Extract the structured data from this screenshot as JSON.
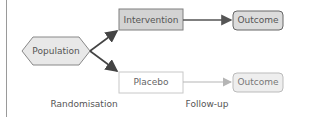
{
  "diagram": {
    "nodes": {
      "population": {
        "label": "Population",
        "shape": "hexagon",
        "fill": "#e8e8e8",
        "stroke": "#888888"
      },
      "intervention": {
        "label": "Intervention",
        "shape": "rectangle",
        "fill": "#d3d3d3",
        "stroke": "#7f7f7f"
      },
      "placebo": {
        "label": "Placebo",
        "shape": "rectangle",
        "fill": "#ffffff",
        "stroke": "#c8c8c8"
      },
      "outcome_top": {
        "label": "Outcome",
        "shape": "rounded-rectangle",
        "fill": "#dcdcdc",
        "stroke": "#666666"
      },
      "outcome_bottom": {
        "label": "Outcome",
        "shape": "rounded-rectangle",
        "fill": "#eeeeee",
        "stroke": "#bbbbbb"
      }
    },
    "edges": [
      {
        "from": "population",
        "to": "intervention",
        "color": "#444444"
      },
      {
        "from": "population",
        "to": "placebo",
        "color": "#444444"
      },
      {
        "from": "intervention",
        "to": "outcome_top",
        "color": "#555555"
      },
      {
        "from": "placebo",
        "to": "outcome_bottom",
        "color": "#b5b5b5"
      }
    ],
    "stage_labels": {
      "randomisation": "Randomisation",
      "followup": "Follow-up"
    }
  }
}
